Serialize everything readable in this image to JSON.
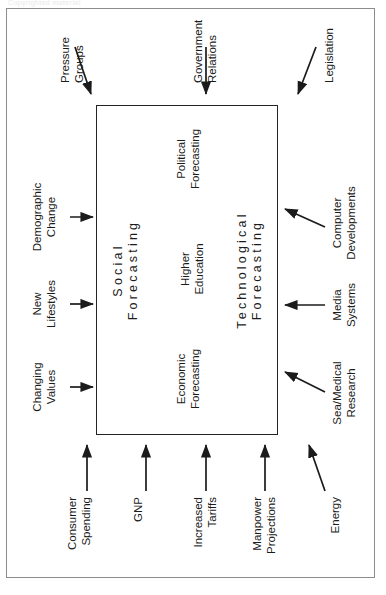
{
  "page": {
    "scan_watermark": "Copyrighted material",
    "domain_note": "rotated book figure"
  },
  "figure": {
    "core": {
      "top_label_line1": "Social",
      "top_label_line2": "Forecasting",
      "bottom_label_line1": "Technological",
      "bottom_label_line2": "Forecasting",
      "items": [
        {
          "line1": "Economic",
          "line2": "Forecasting"
        },
        {
          "line1": "Higher",
          "line2": "Education"
        },
        {
          "line1": "Political",
          "line2": "Forecasting"
        }
      ]
    },
    "inputs_top": [
      {
        "line1": "Changing",
        "line2": "Values"
      },
      {
        "line1": "New",
        "line2": "Lifestyles"
      },
      {
        "line1": "Demographic",
        "line2": "Change"
      }
    ],
    "inputs_left": [
      {
        "line1": "Energy",
        "line2": ""
      },
      {
        "line1": "Manpower",
        "line2": "Projections"
      },
      {
        "line1": "Increased",
        "line2": "Tariffs"
      },
      {
        "line1": "GNP",
        "line2": ""
      },
      {
        "line1": "Consumer",
        "line2": "Spending"
      }
    ],
    "inputs_bottom": [
      {
        "line1": "Sea/Medical",
        "line2": "Research"
      },
      {
        "line1": "Media",
        "line2": "Systems"
      },
      {
        "line1": "Computer",
        "line2": "Developments"
      }
    ],
    "inputs_right": [
      {
        "line1": "Legislation",
        "line2": ""
      },
      {
        "line1": "Government",
        "line2": "Relations"
      },
      {
        "line1": "Pressure",
        "line2": "Groups"
      }
    ]
  },
  "colors": {
    "ink": "#242424",
    "frame": "#8d8d8d",
    "paper": "#ffffff"
  }
}
